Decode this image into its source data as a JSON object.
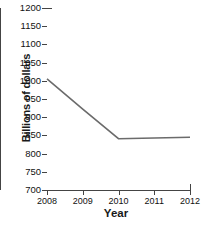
{
  "chart_data": {
    "type": "line",
    "title": "",
    "xlabel": "Year",
    "ylabel": "Billions of dollars",
    "x": [
      2008,
      2009,
      2010,
      2011,
      2012
    ],
    "xticklabels": [
      "2008",
      "2009",
      "2010",
      "2011",
      "2012"
    ],
    "xlim": [
      2008,
      2012
    ],
    "yticks": [
      700,
      750,
      800,
      850,
      900,
      950,
      1000,
      1050,
      1100,
      1150,
      1200
    ],
    "yticklabels": [
      "700",
      "750",
      "800",
      "850",
      "900",
      "950",
      "1000",
      "1050",
      "1100",
      "1150",
      "1200"
    ],
    "ylim": [
      700,
      1200
    ],
    "grid": false,
    "legend": false,
    "series": [
      {
        "name": "Billions of dollars",
        "color": "#6b6b6b",
        "values": [
          1005,
          922,
          841,
          843,
          845
        ]
      }
    ]
  }
}
